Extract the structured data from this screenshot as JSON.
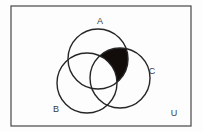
{
  "figure": {
    "background_color": "#fdfdfd",
    "stroke_color": "#262626",
    "shade_color": "#120c0a",
    "border_color": "#555555",
    "label_color": "#3a3a3a"
  },
  "universal_set": {
    "label": "U",
    "label_x": 174,
    "label_y": 114,
    "rect": {
      "x": 11,
      "y": 6,
      "width": 180,
      "height": 120
    }
  },
  "sets": [
    {
      "id": "A",
      "label": "A",
      "label_x": 100,
      "label_y": 22,
      "cx": 98,
      "cy": 59,
      "r": 30
    },
    {
      "id": "B",
      "label": "B",
      "label_x": 56,
      "label_y": 110,
      "cx": 87,
      "cy": 83,
      "r": 30
    },
    {
      "id": "C",
      "label": "C",
      "label_x": 152,
      "label_y": 72,
      "cx": 120,
      "cy": 78,
      "r": 30
    }
  ],
  "shaded_region": {
    "name": "A-intersect-C-minus-B",
    "description": "A ∩ C ∩ B'",
    "fill": "#120c0a"
  }
}
